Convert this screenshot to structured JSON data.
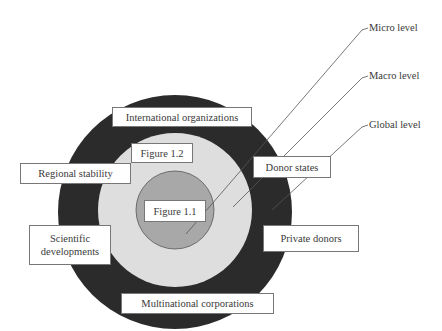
{
  "diagram": {
    "levels": [
      {
        "id": "micro",
        "label": "Micro level"
      },
      {
        "id": "macro",
        "label": "Macro level"
      },
      {
        "id": "global",
        "label": "Global level"
      }
    ],
    "rings": {
      "outer": {
        "level": "global",
        "color": "#2b2b2b"
      },
      "middle": {
        "level": "macro",
        "color": "#dedede"
      },
      "inner": {
        "level": "micro",
        "color": "#a8a8a8"
      }
    },
    "labels": {
      "international_organizations": "International organizations",
      "figure_1_2": "Figure 1.2",
      "regional_stability": "Regional stability",
      "donor_states": "Donor states",
      "figure_1_1": "Figure 1.1",
      "scientific_developments_line1": "Scientific",
      "scientific_developments_line2": "developments",
      "private_donors": "Private donors",
      "multinational_corporations": "Multinational corporations"
    }
  }
}
